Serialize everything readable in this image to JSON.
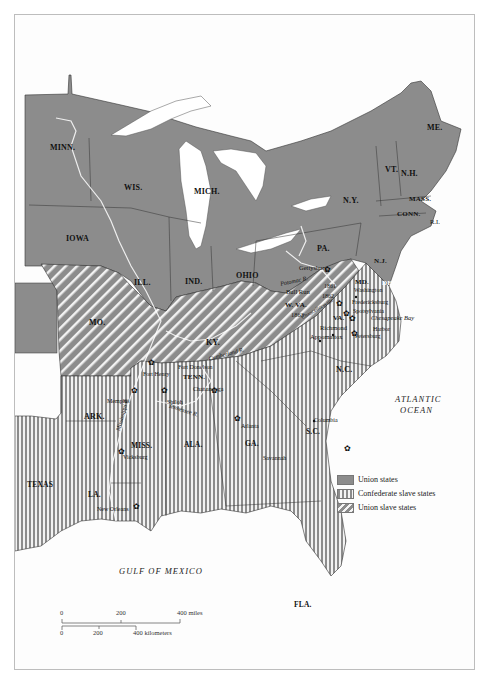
{
  "map": {
    "colors": {
      "union": "#8c8c8c",
      "confederate_stripe": "#8c8c8c",
      "union_slave_stripe": "#8c8c8c",
      "water": "#ffffff",
      "border": "#333333",
      "background": "#fdfdfd"
    },
    "states": {
      "minn": "MINN.",
      "wis": "WIS.",
      "mich": "MICH.",
      "iowa": "IOWA",
      "ill": "ILL.",
      "ind": "IND.",
      "ohio": "OHIO",
      "pa": "PA.",
      "ny": "N.Y.",
      "vt": "VT.",
      "nh": "N.H.",
      "me": "ME.",
      "mass": "MASS.",
      "conn": "CONN.",
      "ri": "R.I.",
      "nj": "N.J.",
      "del": "DEL.",
      "md": "MD.",
      "wva": "W. VA.",
      "wva_year": "1863",
      "va": "VA.",
      "mo": "MO.",
      "ky": "KY.",
      "tenn": "TENN.",
      "nc": "N.C.",
      "sc": "S.C.",
      "ga": "GA.",
      "ala": "ALA.",
      "miss": "MISS.",
      "ark": "ARK.",
      "la": "LA.",
      "texas": "TEXAS",
      "fla": "FLA."
    },
    "cities": {
      "gettysburg": "Gettysburg",
      "bull_run": "Bull Run",
      "year_1861": "1861",
      "year_1862": "1862",
      "washington": "Washington",
      "fredericksburg": "Fredericksburg",
      "spotsylvania": "Spotsylvania",
      "chancellorsville": "Chancellorsville",
      "richmond": "Richmond",
      "appomattox": "Appomattox",
      "harbor": "Harbor",
      "petersburg": "Petersburg",
      "fort_donelson": "Fort Donelson",
      "fort_henry": "Fort Henry",
      "chattanooga": "Chattanooga",
      "memphis": "Memphis",
      "shiloh": "Shiloh",
      "atlanta": "Atlanta",
      "columbia": "Columbia",
      "savannah": "Savannah",
      "vicksburg": "Vicksburg",
      "new_orleans": "New Orleans"
    },
    "rivers": {
      "potomac": "Potomac R.",
      "cumberland": "Cumberland R.",
      "tennessee": "Tennessee R.",
      "mississippi": "Mississippi R."
    },
    "water_bodies": {
      "chesapeake": "Chesapeake Bay",
      "atlantic_line1": "ATLANTIC",
      "atlantic_line2": "OCEAN",
      "gulf": "GULF OF MEXICO"
    },
    "legend": [
      {
        "key": "union",
        "label": "Union states"
      },
      {
        "key": "confederate",
        "label": "Confederate slave states"
      },
      {
        "key": "union_slave",
        "label": "Union slave states"
      }
    ],
    "scale": {
      "miles_ticks": [
        "0",
        "200",
        "400 miles"
      ],
      "km_ticks": [
        "0",
        "200",
        "400 kilometers"
      ]
    }
  }
}
